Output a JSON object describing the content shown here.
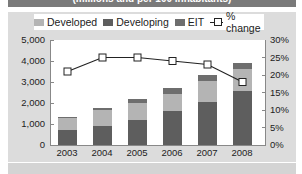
{
  "banner": {
    "subtitle": "(millions and per 100 inhabitants)"
  },
  "legend": {
    "items": [
      {
        "label": "Developed",
        "color": "#b4b4b4"
      },
      {
        "label": "Developing",
        "color": "#5e5e5e"
      },
      {
        "label": "EIT",
        "color": "#6e6e6e"
      },
      {
        "label": "% change",
        "marker": "square-line"
      }
    ]
  },
  "axes": {
    "left_ticks": [
      "0",
      "1,000",
      "2,000",
      "3,000",
      "4,000",
      "5,000"
    ],
    "right_ticks": [
      "0%",
      "5%",
      "10%",
      "15%",
      "20%",
      "25%",
      "30%"
    ],
    "x_ticks": [
      "2003",
      "2004",
      "2005",
      "2006",
      "2007",
      "2008"
    ]
  },
  "chart_data": {
    "type": "bar",
    "subtype": "stacked bar with line on secondary axis",
    "title": "(millions and per 100 inhabitants)",
    "categories": [
      "2003",
      "2004",
      "2005",
      "2006",
      "2007",
      "2008"
    ],
    "series": [
      {
        "name": "Developing",
        "type": "bar",
        "axis": "left",
        "values": [
          700,
          900,
          1200,
          1600,
          2050,
          2550
        ]
      },
      {
        "name": "Developed",
        "type": "bar",
        "axis": "left",
        "values": [
          620,
          750,
          800,
          850,
          1000,
          1050
        ]
      },
      {
        "name": "EIT",
        "type": "bar",
        "axis": "left",
        "values": [
          30,
          100,
          200,
          250,
          300,
          300
        ]
      },
      {
        "name": "% change",
        "type": "line",
        "axis": "right",
        "values": [
          21,
          25,
          25,
          24,
          23,
          18
        ]
      }
    ],
    "xlabel": "",
    "ylabel_left": "",
    "ylabel_right": "",
    "ylim_left": [
      0,
      5000
    ],
    "ylim_right": [
      0,
      30
    ],
    "legend_position": "top",
    "grid": false
  }
}
